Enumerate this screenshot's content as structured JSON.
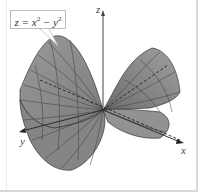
{
  "figure": {
    "equation": {
      "lhs": "z",
      "eq": " = ",
      "x": "x",
      "minus": " − ",
      "y": "y",
      "exp": "2"
    },
    "axes": {
      "x_label": "x",
      "y_label": "y",
      "z_label": "z"
    },
    "surface": {
      "name": "hyperbolic paraboloid (saddle)",
      "fill_color": "#8c8c8c",
      "mesh_color": "#3a3a3a",
      "axis_color": "#333333",
      "border_color": "#d8d8d8"
    }
  }
}
